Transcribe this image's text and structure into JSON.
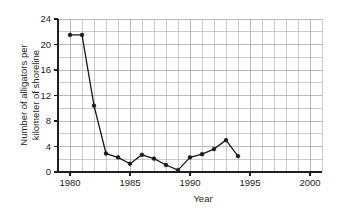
{
  "chart_data": {
    "type": "line",
    "title": "",
    "xlabel": "Year",
    "ylabel": "Number of alligators per kilometer of shoreline",
    "ylabel_line1": "Number of alligators per",
    "ylabel_line2": "kilometer of shoreline",
    "xlim": [
      1979,
      2001
    ],
    "ylim": [
      0,
      24
    ],
    "x": [
      1980,
      1981,
      1982,
      1983,
      1984,
      1985,
      1986,
      1987,
      1988,
      1989,
      1990,
      1991,
      1992,
      1993,
      1994
    ],
    "values": [
      21.5,
      21.5,
      10.4,
      2.9,
      2.3,
      1.3,
      2.7,
      2.1,
      1.1,
      0.3,
      2.3,
      2.8,
      3.6,
      5.0,
      2.5
    ],
    "xticks": [
      1980,
      1985,
      1990,
      1995,
      2000
    ],
    "xtick_labels": [
      "1980",
      "1985",
      "1990",
      "1995",
      "2000"
    ],
    "yticks": [
      0,
      4,
      8,
      12,
      16,
      20,
      24
    ],
    "ytick_labels": [
      "0",
      "4",
      "8",
      "12",
      "16",
      "20",
      "24"
    ],
    "x_minor_step": 1,
    "y_minor_step": 2,
    "grid": true,
    "legend": null,
    "marker": "filled-circle",
    "line_color": "#1a1a1a",
    "marker_color": "#1a1a1a",
    "grid_color": "#a8a8a8",
    "axis_color": "#231f20",
    "background_color": "#ffffff"
  }
}
